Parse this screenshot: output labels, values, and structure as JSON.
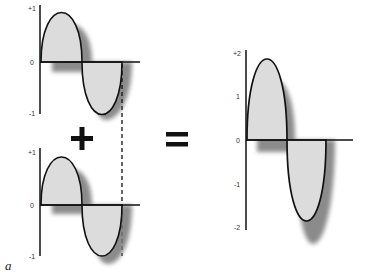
{
  "figure": {
    "panel_label": "a",
    "operators": {
      "plus": "+",
      "equals": "="
    },
    "colors": {
      "fill": "#d9d9d9",
      "shadow": "#7a7a7a",
      "stroke": "#111111",
      "axis": "#111111"
    }
  },
  "plots": {
    "top_left": {
      "ticks": {
        "max": "+1",
        "zero": "0",
        "min": "-1"
      },
      "amplitude": 1
    },
    "bottom_left": {
      "ticks": {
        "max": "+1",
        "zero": "0",
        "min": "-1"
      },
      "amplitude": 1
    },
    "right": {
      "ticks": {
        "max": "+2",
        "one": "1",
        "zero": "0",
        "neg_one": "-1",
        "min": "-2"
      },
      "amplitude": 2
    }
  }
}
